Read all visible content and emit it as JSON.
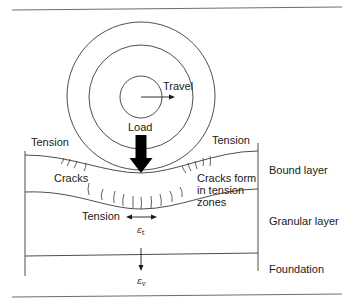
{
  "diagram": {
    "labels": {
      "travel": "Travel",
      "load": "Load",
      "tension_left": "Tension",
      "tension_right": "Tension",
      "cracks": "Cracks",
      "cracks_form_line1": "Cracks form",
      "cracks_form_line2": "in tension",
      "cracks_form_line3": "zones",
      "tension_bottom": "Tension",
      "strain_tensile": "ε",
      "strain_tensile_sub": "t",
      "strain_vertical": "ε",
      "strain_vertical_sub": "v"
    },
    "layers": [
      {
        "label": "Bound layer"
      },
      {
        "label": "Granular layer"
      },
      {
        "label": "Foundation"
      }
    ],
    "colors": {
      "stroke": "#3a3a3a",
      "arrow_fill": "#000000",
      "rule": "#6e6e6e"
    }
  }
}
